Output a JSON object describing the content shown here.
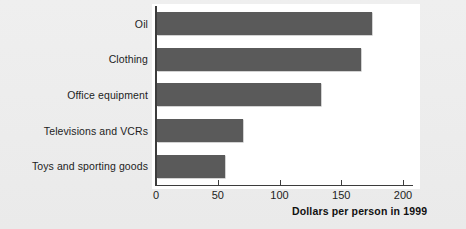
{
  "chart_data": {
    "type": "bar",
    "orientation": "horizontal",
    "title": "",
    "xlabel": "Dollars per person in 1999",
    "ylabel": "",
    "categories": [
      "Oil",
      "Clothing",
      "Office equipment",
      "Televisions and VCRs",
      "Toys and sporting goods"
    ],
    "values": [
      174,
      165,
      133,
      70,
      55
    ],
    "xlim": [
      0,
      200
    ],
    "xticks": [
      0,
      50,
      100,
      150,
      200
    ],
    "xtick_labels": [
      "0",
      "50",
      "100",
      "150",
      "200"
    ],
    "grid": false,
    "legend": null,
    "bar_color": "#5a5a5a",
    "plot_background": "#ffffff",
    "figure_background": "#ececec",
    "axis_color": "#3c3c3c"
  }
}
